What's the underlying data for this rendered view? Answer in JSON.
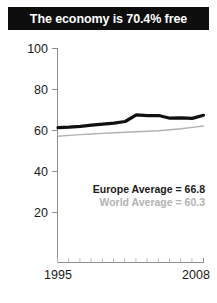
{
  "banner": {
    "title": "The economy is 70.4% free"
  },
  "annotations": {
    "europe": "Europe Average = 66.8",
    "world": "World Average = 60.3"
  },
  "colors": {
    "banner_background": "#0d0d0d",
    "banner_text": "#ffffff",
    "europe_line": "#111111",
    "world_line": "#b0b0b0",
    "axis": "#8e8e8e",
    "tick_minor": "#b5b5b5",
    "annotation_europe_text": "#1a1a1a",
    "annotation_world_text": "#b3b3b3",
    "background": "#ffffff"
  },
  "chart_data": {
    "type": "line",
    "title": "The economy is 70.4% free",
    "xlabel": "",
    "ylabel": "",
    "x": [
      1995,
      1996,
      1997,
      1998,
      1999,
      2000,
      2001,
      2002,
      2003,
      2004,
      2005,
      2006,
      2007,
      2008
    ],
    "xlim": [
      1995,
      2008
    ],
    "ylim": [
      0,
      100
    ],
    "yticks": [
      20,
      40,
      60,
      80,
      100
    ],
    "ytick_labels": [
      "20",
      "40",
      "60",
      "80",
      "100"
    ],
    "xticks": [
      1995,
      2008
    ],
    "xtick_labels": [
      "1995",
      "2008"
    ],
    "grid": false,
    "legend": "none",
    "series": [
      {
        "name": "Country",
        "color": "#111111",
        "values": [
          61.4,
          61.6,
          62.0,
          62.6,
          63.1,
          63.6,
          64.4,
          67.6,
          67.2,
          67.3,
          66.0,
          66.2,
          65.9,
          67.4
        ]
      },
      {
        "name": "World Average",
        "color": "#b0b0b0",
        "values": [
          57.2,
          57.6,
          58.0,
          58.3,
          58.6,
          58.9,
          59.1,
          59.4,
          59.6,
          59.9,
          60.4,
          60.9,
          61.5,
          62.2
        ]
      }
    ],
    "annotations": [
      {
        "text": "Europe Average = 66.8",
        "value": 66.8
      },
      {
        "text": "World Average = 60.3",
        "value": 60.3
      }
    ]
  }
}
